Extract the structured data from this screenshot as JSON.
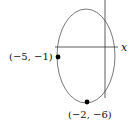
{
  "diagram": {
    "type": "ellipse-on-coordinate-axes",
    "axes": {
      "x_label": "x"
    },
    "points": [
      {
        "label": "(−5, −1)",
        "x": -5,
        "y": -1
      },
      {
        "label": "(−2, −6)",
        "x": -2,
        "y": -6
      }
    ],
    "colors": {
      "stroke": "#333333",
      "point": "#000000",
      "background": "#ffffff"
    }
  }
}
